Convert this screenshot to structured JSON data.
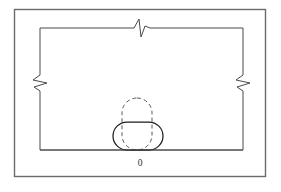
{
  "figure": {
    "canvas": {
      "width": 281,
      "height": 192,
      "background": "#ffffff"
    },
    "frame": {
      "label": "outer-frame",
      "x": 14.5,
      "y": 9.5,
      "width": 251,
      "height": 167,
      "stroke": "#6b6b6b",
      "stroke_width": 1.4
    },
    "circuit": {
      "label": "circuit-loop",
      "left": 40,
      "top": 28,
      "right": 243,
      "bottom": 150,
      "stroke": "#4a4a4a",
      "stroke_width": 1
    },
    "breaks": [
      {
        "name": "break-top",
        "orientation": "horizontal-line",
        "position_x": 142,
        "position_y": 28,
        "path": "M 134 28 L 139 19 L 141 37 L 145 26 L 150 28"
      },
      {
        "name": "break-left",
        "orientation": "vertical-line",
        "position_x": 40,
        "position_y": 83,
        "path": "M 40 75 L 33 80 L 47 83 L 34 87 L 40 91"
      },
      {
        "name": "break-right",
        "orientation": "vertical-line",
        "position_x": 243,
        "position_y": 83,
        "path": "M 243 75 L 236 80 L 250 83 L 237 87 L 243 91"
      }
    ],
    "solid_stadium": {
      "name": "solid-stadium",
      "x": 113,
      "y": 122,
      "width": 50,
      "height": 28,
      "radius": 14,
      "stroke": "#1d1d1d",
      "stroke_width": 1.25,
      "style": "solid"
    },
    "dashed_stadium": {
      "name": "dashed-stadium",
      "x": 122,
      "y": 98,
      "width": 30,
      "height": 52,
      "radius": 15,
      "stroke": "#5a5a5a",
      "stroke_width": 1,
      "style": "dashed",
      "dash_pattern": "4 3"
    },
    "node_label": {
      "name": "node-label",
      "text": "0",
      "x": 140,
      "y": 166
    }
  }
}
